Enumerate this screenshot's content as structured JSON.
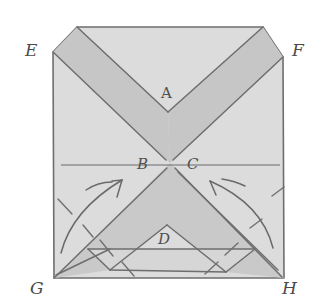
{
  "figure": {
    "type": "hand-drawn origami folding diagram",
    "colors": {
      "background": "#ffffff",
      "paper_light": "#dcdcdc",
      "paper_band": "#c6c6c6",
      "line": "#6e6e6e"
    },
    "corner_labels": {
      "E": "E",
      "F": "F",
      "G": "G",
      "H": "H"
    },
    "inner_labels": {
      "A": "A",
      "B": "B",
      "C": "C",
      "D": "D"
    },
    "arrows": [
      {
        "name": "left-fold-arrow",
        "direction": "up-right",
        "from": "G",
        "to": "B"
      },
      {
        "name": "right-fold-arrow",
        "direction": "up-left",
        "from": "H",
        "to": "C"
      }
    ]
  }
}
